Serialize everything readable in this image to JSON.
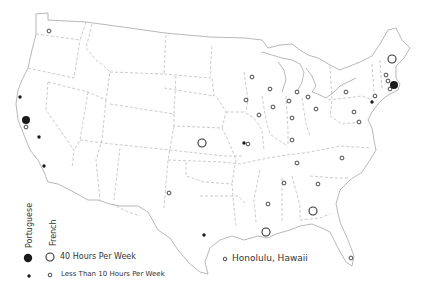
{
  "legend": {
    "portuguese_label": "Portuguese",
    "french_label": "French",
    "large_label": "40 Hours Per Week",
    "small_label": "Less Than 10 Hours Per Week"
  },
  "hawaii_label": "Honolulu, Hawaii",
  "colors": {
    "portuguese": "#1a1a1a",
    "french_stroke": "#333333",
    "borders": "#9a9a9a"
  },
  "markers": [
    {
      "lang": "french",
      "size": "small",
      "x": 49,
      "y": 31
    },
    {
      "lang": "portuguese",
      "size": "small",
      "x": 20,
      "y": 97
    },
    {
      "lang": "portuguese",
      "size": "large",
      "x": 26,
      "y": 120
    },
    {
      "lang": "french",
      "size": "small",
      "x": 26,
      "y": 127
    },
    {
      "lang": "portuguese",
      "size": "small",
      "x": 39,
      "y": 137
    },
    {
      "lang": "portuguese",
      "size": "small",
      "x": 44,
      "y": 166
    },
    {
      "lang": "french",
      "size": "large",
      "x": 202,
      "y": 143
    },
    {
      "lang": "portuguese",
      "size": "small",
      "x": 244,
      "y": 143
    },
    {
      "lang": "french",
      "size": "small",
      "x": 248,
      "y": 144
    },
    {
      "lang": "french",
      "size": "small",
      "x": 169,
      "y": 193
    },
    {
      "lang": "portuguese",
      "size": "small",
      "x": 204,
      "y": 235
    },
    {
      "lang": "french",
      "size": "large",
      "x": 266,
      "y": 232
    },
    {
      "lang": "french",
      "size": "small",
      "x": 268,
      "y": 204
    },
    {
      "lang": "french",
      "size": "small",
      "x": 284,
      "y": 183
    },
    {
      "lang": "french",
      "size": "large",
      "x": 313,
      "y": 211
    },
    {
      "lang": "french",
      "size": "small",
      "x": 318,
      "y": 184
    },
    {
      "lang": "french",
      "size": "small",
      "x": 297,
      "y": 163
    },
    {
      "lang": "french",
      "size": "small",
      "x": 342,
      "y": 158
    },
    {
      "lang": "french",
      "size": "small",
      "x": 351,
      "y": 258
    },
    {
      "lang": "french",
      "size": "small",
      "x": 252,
      "y": 77
    },
    {
      "lang": "french",
      "size": "small",
      "x": 270,
      "y": 89
    },
    {
      "lang": "french",
      "size": "small",
      "x": 246,
      "y": 100
    },
    {
      "lang": "french",
      "size": "small",
      "x": 273,
      "y": 107
    },
    {
      "lang": "french",
      "size": "small",
      "x": 259,
      "y": 115
    },
    {
      "lang": "french",
      "size": "small",
      "x": 297,
      "y": 92
    },
    {
      "lang": "french",
      "size": "small",
      "x": 289,
      "y": 101
    },
    {
      "lang": "french",
      "size": "small",
      "x": 308,
      "y": 97
    },
    {
      "lang": "french",
      "size": "small",
      "x": 292,
      "y": 118
    },
    {
      "lang": "french",
      "size": "small",
      "x": 316,
      "y": 109
    },
    {
      "lang": "french",
      "size": "small",
      "x": 292,
      "y": 140
    },
    {
      "lang": "french",
      "size": "small",
      "x": 346,
      "y": 92
    },
    {
      "lang": "french",
      "size": "small",
      "x": 354,
      "y": 112
    },
    {
      "lang": "french",
      "size": "small",
      "x": 359,
      "y": 122
    },
    {
      "lang": "french",
      "size": "small",
      "x": 375,
      "y": 96
    },
    {
      "lang": "portuguese",
      "size": "small",
      "x": 372,
      "y": 102
    },
    {
      "lang": "french",
      "size": "large",
      "x": 392,
      "y": 59
    },
    {
      "lang": "french",
      "size": "small",
      "x": 386,
      "y": 75
    },
    {
      "lang": "french",
      "size": "small",
      "x": 388,
      "y": 81
    },
    {
      "lang": "french",
      "size": "small",
      "x": 390,
      "y": 89
    },
    {
      "lang": "portuguese",
      "size": "large",
      "x": 394,
      "y": 85
    }
  ]
}
